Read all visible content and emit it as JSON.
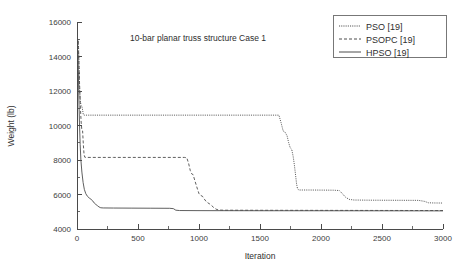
{
  "chart_data": {
    "type": "line",
    "title": "10-bar planar truss structure Case 1",
    "xlabel": "Iteration",
    "ylabel": "Weight (lb)",
    "xlim": [
      0,
      3000
    ],
    "ylim": [
      4000,
      16000
    ],
    "xticks": [
      0,
      500,
      1000,
      1500,
      2000,
      2500,
      3000
    ],
    "xtick_labels": [
      "0",
      "500",
      "1000",
      "1500",
      "2000",
      "2500",
      "3000"
    ],
    "yticks": [
      4000,
      6000,
      8000,
      10000,
      12000,
      14000,
      16000
    ],
    "ytick_labels": [
      "4000",
      "6000",
      "8000",
      "10000",
      "12000",
      "14000",
      "16000"
    ],
    "x_minor_interval": 250,
    "y_minor_interval": 1000,
    "grid": false,
    "legend_position": "top-right",
    "series": [
      {
        "name": "PSO [19]",
        "style": "dotted",
        "points": [
          [
            10,
            15000
          ],
          [
            14,
            14300
          ],
          [
            18,
            13000
          ],
          [
            22,
            12000
          ],
          [
            28,
            11400
          ],
          [
            34,
            11100
          ],
          [
            40,
            11100
          ],
          [
            46,
            10900
          ],
          [
            52,
            10620
          ],
          [
            60,
            10600
          ],
          [
            200,
            10600
          ],
          [
            600,
            10600
          ],
          [
            1000,
            10600
          ],
          [
            1400,
            10600
          ],
          [
            1655,
            10600
          ],
          [
            1672,
            10180
          ],
          [
            1690,
            9680
          ],
          [
            1705,
            9620
          ],
          [
            1722,
            9400
          ],
          [
            1735,
            9000
          ],
          [
            1748,
            8700
          ],
          [
            1760,
            8620
          ],
          [
            1772,
            8200
          ],
          [
            1782,
            7700
          ],
          [
            1792,
            7100
          ],
          [
            1800,
            6600
          ],
          [
            1808,
            6320
          ],
          [
            1820,
            6260
          ],
          [
            1900,
            6260
          ],
          [
            2000,
            6255
          ],
          [
            2100,
            6250
          ],
          [
            2150,
            6230
          ],
          [
            2175,
            6050
          ],
          [
            2200,
            5850
          ],
          [
            2230,
            5720
          ],
          [
            2270,
            5680
          ],
          [
            2400,
            5670
          ],
          [
            2600,
            5665
          ],
          [
            2800,
            5660
          ],
          [
            2850,
            5600
          ],
          [
            2880,
            5520
          ],
          [
            2920,
            5510
          ],
          [
            3000,
            5505
          ]
        ]
      },
      {
        "name": "PSOPC [19]",
        "style": "dashed",
        "points": [
          [
            10,
            14900
          ],
          [
            16,
            13500
          ],
          [
            22,
            12200
          ],
          [
            28,
            11000
          ],
          [
            34,
            10200
          ],
          [
            40,
            9700
          ],
          [
            46,
            9680
          ],
          [
            52,
            8900
          ],
          [
            58,
            8300
          ],
          [
            64,
            8160
          ],
          [
            80,
            8150
          ],
          [
            300,
            8150
          ],
          [
            600,
            8150
          ],
          [
            880,
            8150
          ],
          [
            900,
            8130
          ],
          [
            915,
            7800
          ],
          [
            928,
            7400
          ],
          [
            940,
            7200
          ],
          [
            952,
            7150
          ],
          [
            962,
            6900
          ],
          [
            975,
            6600
          ],
          [
            988,
            6300
          ],
          [
            1000,
            6050
          ],
          [
            1012,
            5950
          ],
          [
            1028,
            5900
          ],
          [
            1042,
            5750
          ],
          [
            1058,
            5600
          ],
          [
            1072,
            5520
          ],
          [
            1088,
            5450
          ],
          [
            1105,
            5350
          ],
          [
            1120,
            5250
          ],
          [
            1140,
            5150
          ],
          [
            1160,
            5100
          ],
          [
            1200,
            5090
          ],
          [
            1500,
            5085
          ],
          [
            2000,
            5080
          ],
          [
            2500,
            5075
          ],
          [
            3000,
            5070
          ]
        ]
      },
      {
        "name": "HPSO [19]",
        "style": "solid",
        "points": [
          [
            8,
            14200
          ],
          [
            14,
            12000
          ],
          [
            20,
            10200
          ],
          [
            26,
            8900
          ],
          [
            32,
            8000
          ],
          [
            40,
            7300
          ],
          [
            50,
            6700
          ],
          [
            60,
            6300
          ],
          [
            72,
            6050
          ],
          [
            85,
            5900
          ],
          [
            100,
            5800
          ],
          [
            115,
            5720
          ],
          [
            130,
            5620
          ],
          [
            142,
            5500
          ],
          [
            155,
            5420
          ],
          [
            168,
            5350
          ],
          [
            180,
            5280
          ],
          [
            195,
            5230
          ],
          [
            215,
            5220
          ],
          [
            300,
            5215
          ],
          [
            450,
            5210
          ],
          [
            600,
            5205
          ],
          [
            760,
            5200
          ],
          [
            790,
            5180
          ],
          [
            810,
            5090
          ],
          [
            840,
            5070
          ],
          [
            1000,
            5065
          ],
          [
            1500,
            5060
          ],
          [
            2000,
            5058
          ],
          [
            2500,
            5055
          ],
          [
            3000,
            5050
          ]
        ]
      }
    ]
  },
  "legend": {
    "entries": [
      {
        "label": "PSO [19]"
      },
      {
        "label": "PSOPC [19]"
      },
      {
        "label": "HPSO [19]"
      }
    ]
  },
  "colors": {
    "background": "#ffffff",
    "axis": "#4a4a4a",
    "line": "#4d4d4d",
    "text": "#2e2e2e"
  }
}
